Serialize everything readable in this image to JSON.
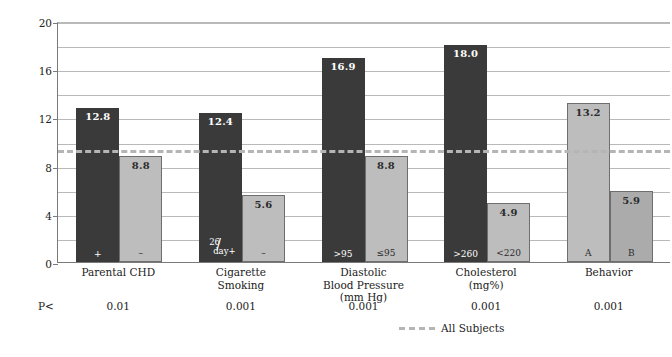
{
  "chart_data": {
    "type": "bar",
    "title": "",
    "xlabel": "",
    "ylabel": "Annual Rate/1,000 at Risk",
    "ylim": [
      0,
      20
    ],
    "yticks": [
      0,
      4,
      8,
      12,
      16,
      20
    ],
    "ytick_labels": [
      "0",
      "4",
      "8",
      "12",
      "16",
      "20"
    ],
    "gridlines": [
      2,
      4,
      6,
      8,
      10,
      12,
      14,
      16,
      18,
      20
    ],
    "grid": true,
    "legend_position": "bottom-center",
    "categories": [
      "Parental CHD",
      "Cigarette Smoking",
      "Diastolic Blood Pressure (mm Hg)",
      "Cholesterol (mg%)",
      "Behavior"
    ],
    "groups": [
      {
        "label_lines": [
          "Parental CHD"
        ],
        "p_value": "0.01",
        "bars": [
          {
            "tag": "+",
            "value": 12.8,
            "label": "12.8",
            "shade": "dark"
          },
          {
            "tag": "–",
            "value": 8.8,
            "label": "8.8",
            "shade": "light"
          }
        ]
      },
      {
        "label_lines": [
          "Cigarette",
          "Smoking"
        ],
        "p_value": "0.001",
        "bars": [
          {
            "tag": "26/day+",
            "tag_numerator": "26",
            "tag_denominator": "day+",
            "value": 12.4,
            "label": "12.4",
            "shade": "dark"
          },
          {
            "tag": "–",
            "value": 5.6,
            "label": "5.6",
            "shade": "light"
          }
        ]
      },
      {
        "label_lines": [
          "Diastolic",
          "Blood Pressure",
          "(mm Hg)"
        ],
        "p_value": "0.001",
        "bars": [
          {
            "tag": ">95",
            "value": 16.9,
            "label": "16.9",
            "shade": "dark"
          },
          {
            "tag": "≤95",
            "value": 8.8,
            "label": "8.8",
            "shade": "light"
          }
        ]
      },
      {
        "label_lines": [
          "Cholesterol",
          "(mg%)"
        ],
        "p_value": "0.001",
        "bars": [
          {
            "tag": ">260",
            "value": 18.0,
            "label": "18.0",
            "shade": "dark"
          },
          {
            "tag": "<220",
            "value": 4.9,
            "label": "4.9",
            "shade": "light"
          }
        ]
      },
      {
        "label_lines": [
          "Behavior"
        ],
        "p_value": "0.001",
        "bars": [
          {
            "tag": "A",
            "value": 13.2,
            "label": "13.2",
            "shade": "light"
          },
          {
            "tag": "B",
            "value": 5.9,
            "label": "5.9",
            "shade": "light2"
          }
        ]
      }
    ],
    "reference_line": {
      "label": "All Subjects",
      "value": 9.5,
      "style": "dashed"
    },
    "p_row_label": "P<",
    "colors": {
      "bar_dark": "#3a3a3a",
      "bar_light": "#bdbdbd",
      "bar_light_alt": "#ababab",
      "grid": "#b9b9b9",
      "axis": "#7a7a7a",
      "reference_line": "#b5b5b5",
      "text": "#222222"
    }
  }
}
